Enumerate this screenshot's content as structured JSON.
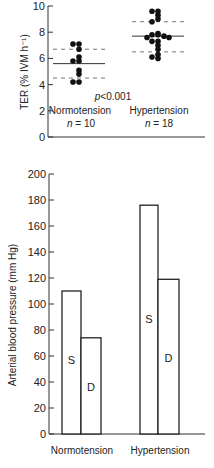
{
  "chart_data": [
    {
      "type": "scatter",
      "title": "",
      "ylabel": "TER (% IVM h⁻¹)",
      "ylim": [
        0,
        10
      ],
      "yticks": [
        0,
        2,
        4,
        6,
        8,
        10
      ],
      "annotation": "p<0.001",
      "annotation_parts": {
        "p": "p",
        "rest": "<0.001"
      },
      "groups": [
        {
          "name": "Normotension",
          "n_label": "n = 10",
          "n_var": "n",
          "n_rest": " = 10",
          "mean": 5.6,
          "sd_upper": 6.7,
          "sd_lower": 4.5,
          "values": [
            7.1,
            7.1,
            6.7,
            6.1,
            5.8,
            5.8,
            5.1,
            4.8,
            4.2,
            4.2
          ]
        },
        {
          "name": "Hypertension",
          "n_label": "n = 18",
          "n_var": "n",
          "n_rest": " = 18",
          "mean": 7.7,
          "sd_upper": 8.8,
          "sd_lower": 6.5,
          "values": [
            9.6,
            9.6,
            9.3,
            9.0,
            8.8,
            7.9,
            7.8,
            7.8,
            7.7,
            7.6,
            7.6,
            7.3,
            7.3,
            7.0,
            6.7,
            6.3,
            6.1,
            6.0
          ]
        }
      ]
    },
    {
      "type": "bar",
      "title": "",
      "ylabel": "Arterial blood pressure (mm Hg)",
      "ylim": [
        0,
        200
      ],
      "yticks": [
        0,
        20,
        40,
        60,
        80,
        100,
        120,
        140,
        160,
        180,
        200
      ],
      "categories": [
        "Normotension",
        "Hypertension"
      ],
      "series": [
        {
          "name": "S",
          "values": [
            110,
            176
          ]
        },
        {
          "name": "D",
          "values": [
            74,
            119
          ]
        }
      ]
    }
  ]
}
